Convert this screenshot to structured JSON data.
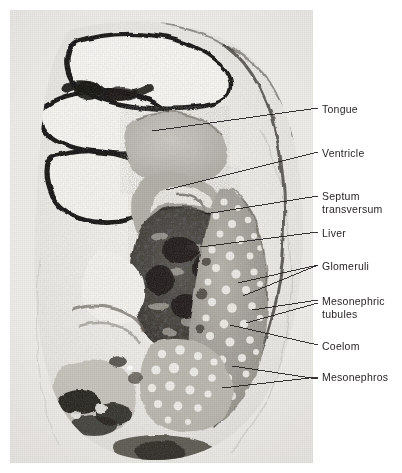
{
  "figure": {
    "kind": "histology-photomicrograph",
    "panel": {
      "x": 10,
      "y": 10,
      "width": 303,
      "height": 453
    },
    "background_color": "#ffffff",
    "photo_base_color": "#e8e7e3",
    "ink_color": "#231f20",
    "label_font_size_px": 10.5
  },
  "labels": [
    {
      "id": "tongue",
      "text": "Tongue",
      "x": 322,
      "y": 103,
      "lines": 1
    },
    {
      "id": "ventricle",
      "text": "Ventricle",
      "x": 322,
      "y": 147,
      "lines": 1
    },
    {
      "id": "septum-transversum",
      "text": "Septum\ntransversum",
      "x": 322,
      "y": 190,
      "lines": 2
    },
    {
      "id": "liver",
      "text": "Liver",
      "x": 322,
      "y": 227,
      "lines": 1
    },
    {
      "id": "glomeruli",
      "text": "Glomeruli",
      "x": 322,
      "y": 260,
      "lines": 1
    },
    {
      "id": "mesonephric-tubules",
      "text": "Mesonephric\ntubules",
      "x": 322,
      "y": 295,
      "lines": 2
    },
    {
      "id": "coelom",
      "text": "Coelom",
      "x": 322,
      "y": 340,
      "lines": 1
    },
    {
      "id": "mesonephros",
      "text": "Mesonephros",
      "x": 322,
      "y": 371,
      "lines": 1
    }
  ],
  "leaders": [
    {
      "id": "leader-tongue",
      "target_label": "tongue",
      "x1": 318,
      "y1": 108,
      "x2": 152,
      "y2": 131
    },
    {
      "id": "leader-ventricle",
      "target_label": "ventricle",
      "x1": 318,
      "y1": 152,
      "x2": 166,
      "y2": 190
    },
    {
      "id": "leader-septum-transversum",
      "target_label": "septum-transversum",
      "x1": 318,
      "y1": 196,
      "x2": 205,
      "y2": 214
    },
    {
      "id": "leader-liver",
      "target_label": "liver",
      "x1": 318,
      "y1": 232,
      "x2": 200,
      "y2": 247
    },
    {
      "id": "leader-glomeruli-a",
      "target_label": "glomeruli",
      "x1": 318,
      "y1": 265,
      "x2": 238,
      "y2": 283
    },
    {
      "id": "leader-glomeruli-b",
      "target_label": "glomeruli",
      "x1": 318,
      "y1": 265,
      "x2": 243,
      "y2": 296
    },
    {
      "id": "leader-mesonephric-tubules-a",
      "target_label": "mesonephric-tubules",
      "x1": 318,
      "y1": 300,
      "x2": 252,
      "y2": 310
    },
    {
      "id": "leader-mesonephric-tubules-b",
      "target_label": "mesonephric-tubules",
      "x1": 318,
      "y1": 303,
      "x2": 246,
      "y2": 323
    },
    {
      "id": "leader-coelom",
      "target_label": "coelom",
      "x1": 318,
      "y1": 345,
      "x2": 230,
      "y2": 325
    },
    {
      "id": "leader-mesonephros-a",
      "target_label": "mesonephros",
      "x1": 318,
      "y1": 377,
      "x2": 222,
      "y2": 388
    },
    {
      "id": "leader-mesonephros-b",
      "target_label": "mesonephros",
      "x1": 318,
      "y1": 379,
      "x2": 232,
      "y2": 366
    }
  ],
  "structures": [
    {
      "id": "neuroepithelium",
      "name": "neural tube / brain wall",
      "tone": "dark"
    },
    {
      "id": "ventricle-lumen",
      "name": "ventricle lumen",
      "tone": "pale"
    },
    {
      "id": "tongue-mass",
      "name": "tongue",
      "tone": "mid"
    },
    {
      "id": "heart-ventricle",
      "name": "heart ventricle",
      "tone": "mid"
    },
    {
      "id": "liver-mass",
      "name": "liver",
      "tone": "very-dark-mottled"
    },
    {
      "id": "mesonephros-mass",
      "name": "mesonephros",
      "tone": "mid-vesicular"
    },
    {
      "id": "coelom-space",
      "name": "coelomic cavity",
      "tone": "pale"
    },
    {
      "id": "gut-loop",
      "name": "gut / hindgut",
      "tone": "dark"
    }
  ]
}
